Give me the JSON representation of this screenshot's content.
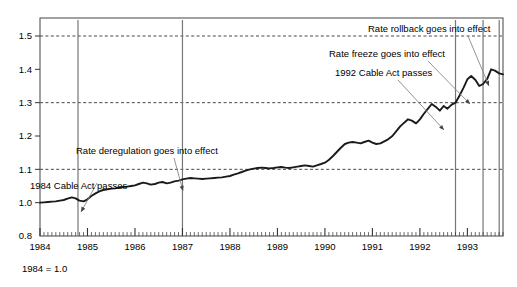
{
  "chart_data": {
    "type": "line",
    "title": "",
    "subtitle": "",
    "xlabel": "",
    "ylabel": "",
    "footnote": "1984 = 1.0",
    "grid": true,
    "grid_values": [
      1.1,
      1.3,
      1.5
    ],
    "legend": [],
    "legend_position": "none",
    "xlim": [
      1984.0,
      1993.75
    ],
    "ylim": [
      0.8,
      1.55
    ],
    "x_tick_labels": [
      "1984",
      "1985",
      "1986",
      "1987",
      "1988",
      "1989",
      "1990",
      "1991",
      "1992",
      "1993"
    ],
    "x_tick_values": [
      1984,
      1985,
      1986,
      1987,
      1988,
      1989,
      1990,
      1991,
      1992,
      1993
    ],
    "x_minor_tick_interval_months": 1,
    "y_tick_labels": [
      "0.8",
      "1.0",
      "1.1",
      "1.2",
      "1.3",
      "1.4",
      "1.5"
    ],
    "y_tick_values": [
      0.8,
      1.0,
      1.1,
      1.2,
      1.3,
      1.4,
      1.5
    ],
    "y_axis_note": "Axis is broken between 0.8 and 1.0; 0.8 sits at the baseline and 1.0 onward are evenly spaced by 0.1.",
    "series": [
      {
        "name": "Cable rate index",
        "x": [
          1984.0,
          1984.08,
          1984.17,
          1984.25,
          1984.33,
          1984.42,
          1984.5,
          1984.58,
          1984.67,
          1984.75,
          1984.83,
          1984.92,
          1985.0,
          1985.08,
          1985.17,
          1985.25,
          1985.33,
          1985.42,
          1985.5,
          1985.58,
          1985.67,
          1985.75,
          1985.83,
          1985.92,
          1986.0,
          1986.08,
          1986.17,
          1986.25,
          1986.33,
          1986.42,
          1986.5,
          1986.58,
          1986.67,
          1986.75,
          1986.83,
          1986.92,
          1987.0,
          1987.08,
          1987.17,
          1987.25,
          1987.33,
          1987.42,
          1987.5,
          1987.58,
          1987.67,
          1987.75,
          1987.83,
          1987.92,
          1988.0,
          1988.08,
          1988.17,
          1988.25,
          1988.33,
          1988.42,
          1988.5,
          1988.58,
          1988.67,
          1988.75,
          1988.83,
          1988.92,
          1989.0,
          1989.08,
          1989.17,
          1989.25,
          1989.33,
          1989.42,
          1989.5,
          1989.58,
          1989.67,
          1989.75,
          1989.83,
          1989.92,
          1990.0,
          1990.08,
          1990.17,
          1990.25,
          1990.33,
          1990.42,
          1990.5,
          1990.58,
          1990.67,
          1990.75,
          1990.83,
          1990.92,
          1991.0,
          1991.08,
          1991.17,
          1991.25,
          1991.33,
          1991.42,
          1991.5,
          1991.58,
          1991.67,
          1991.75,
          1991.83,
          1991.92,
          1992.0,
          1992.08,
          1992.17,
          1992.25,
          1992.33,
          1992.42,
          1992.5,
          1992.58,
          1992.67,
          1992.75,
          1992.83,
          1992.92,
          1993.0,
          1993.08,
          1993.17,
          1993.25,
          1993.33,
          1993.42,
          1993.5,
          1993.58,
          1993.67,
          1993.75
        ],
        "values": [
          1.0,
          1.001,
          1.002,
          1.003,
          1.004,
          1.006,
          1.008,
          1.012,
          1.016,
          1.013,
          1.006,
          1.004,
          1.01,
          1.02,
          1.028,
          1.034,
          1.038,
          1.04,
          1.042,
          1.043,
          1.045,
          1.047,
          1.048,
          1.05,
          1.052,
          1.056,
          1.06,
          1.058,
          1.054,
          1.056,
          1.06,
          1.062,
          1.058,
          1.06,
          1.064,
          1.066,
          1.07,
          1.072,
          1.074,
          1.073,
          1.072,
          1.071,
          1.072,
          1.073,
          1.074,
          1.075,
          1.076,
          1.078,
          1.08,
          1.084,
          1.088,
          1.092,
          1.096,
          1.1,
          1.102,
          1.104,
          1.105,
          1.104,
          1.103,
          1.104,
          1.106,
          1.107,
          1.105,
          1.104,
          1.106,
          1.108,
          1.11,
          1.112,
          1.11,
          1.108,
          1.112,
          1.116,
          1.12,
          1.128,
          1.14,
          1.152,
          1.164,
          1.176,
          1.18,
          1.182,
          1.18,
          1.178,
          1.182,
          1.186,
          1.18,
          1.176,
          1.178,
          1.184,
          1.19,
          1.2,
          1.214,
          1.228,
          1.24,
          1.25,
          1.246,
          1.238,
          1.25,
          1.266,
          1.282,
          1.296,
          1.288,
          1.276,
          1.29,
          1.282,
          1.294,
          1.3,
          1.32,
          1.345,
          1.37,
          1.38,
          1.368,
          1.35,
          1.356,
          1.372,
          1.4,
          1.396,
          1.388,
          1.385
        ]
      }
    ],
    "event_lines": [
      {
        "id": "e1",
        "x": 1984.8,
        "label": "1984 Cable Act passes"
      },
      {
        "id": "e2",
        "x": 1987.0,
        "label": "Rate deregulation goes into effect"
      },
      {
        "id": "e3",
        "x": 1992.75,
        "label": "1992 Cable Act passes"
      },
      {
        "id": "e4",
        "x": 1993.33,
        "label": "Rate freeze goes into effect"
      },
      {
        "id": "e5",
        "x": 1993.67,
        "label": "Rate rollback goes into effect"
      }
    ],
    "annotations": [
      {
        "id": "a1",
        "text": "1984 Cable Act passes",
        "text_x": 30,
        "text_y": 189,
        "anchor": "start",
        "leader": {
          "x1": 97,
          "y1": 183,
          "x2": 81,
          "y2": 212
        }
      },
      {
        "id": "a2",
        "text": "Rate deregulation goes into effect",
        "text_x": 76,
        "text_y": 154,
        "anchor": "start",
        "leader": {
          "x1": 174,
          "y1": 158,
          "x2": 183,
          "y2": 191
        }
      },
      {
        "id": "a3",
        "text": "1992 Cable Act passes",
        "text_x": 335,
        "text_y": 76,
        "anchor": "start",
        "leader": {
          "x1": 398,
          "y1": 80,
          "x2": 444,
          "y2": 130
        }
      },
      {
        "id": "a4",
        "text": "Rate freeze goes into effect",
        "text_x": 329,
        "text_y": 57,
        "anchor": "start",
        "leader": {
          "x1": 428,
          "y1": 61,
          "x2": 470,
          "y2": 104
        }
      },
      {
        "id": "a5",
        "text": "Rate rollback goes into effect",
        "text_x": 368,
        "text_y": 32,
        "anchor": "start",
        "leader": {
          "x1": 468,
          "y1": 36,
          "x2": 489,
          "y2": 86
        }
      }
    ]
  },
  "colors": {
    "frame": "#555555",
    "grid": "#333333",
    "line": "#1a1a1a",
    "event_line": "#777777",
    "leader": "#888888",
    "text": "#000000",
    "background": "#ffffff"
  }
}
